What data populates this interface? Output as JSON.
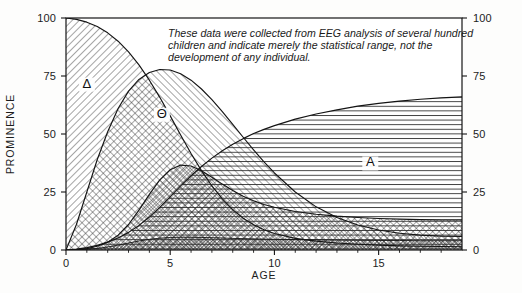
{
  "figure": {
    "annotation_lines": [
      "These data were collected from EEG analysis of several hundred",
      "children and indicate merely the statistical range, not the",
      "development of any individual."
    ],
    "annotation": "These data were collected from EEG analysis of several hundred children and indicate merely the statistical range, not the development of any individual.",
    "colors": {
      "ink": "#1a1a1a",
      "axis": "#141414",
      "background": "#fdfdfc",
      "hatch": "#2a2a2a"
    }
  },
  "chart_data": {
    "type": "area",
    "title": "",
    "subtitle": "",
    "xlabel": "AGE",
    "ylabel": "PROMINENCE",
    "xlim": [
      0,
      19
    ],
    "ylim": [
      0,
      100
    ],
    "xticks": [
      0,
      5,
      10,
      15
    ],
    "xticklabels": [
      "0",
      "5",
      "10",
      "15"
    ],
    "xminorticks": [
      1,
      2,
      3,
      4,
      6,
      7,
      8,
      9,
      11,
      12,
      13,
      14,
      16,
      17,
      18
    ],
    "yticks": [
      0,
      25,
      50,
      75,
      100
    ],
    "yticklabels": [
      "0",
      "25",
      "50",
      "75",
      "100"
    ],
    "yticks_right": [
      0,
      25,
      50,
      75,
      100
    ],
    "yticklabels_right": [
      "0",
      "25",
      "50",
      "75",
      "100"
    ],
    "grid": false,
    "legend": "inline-labels",
    "annotations": [
      {
        "text": "These data were collected from EEG analysis of several hundred children and indicate merely the statistical range, not the development of any individual.",
        "x": 6.0,
        "y": 94
      }
    ],
    "series": [
      {
        "name": "Delta",
        "label": "Δ",
        "label_x": 1.0,
        "label_y": 70,
        "fill": "diagonal-hatch-right",
        "x": [
          0,
          0.5,
          1,
          1.5,
          2,
          2.5,
          3,
          3.5,
          4,
          4.5,
          5,
          5.5,
          6,
          6.5,
          7,
          7.5,
          8,
          8.5,
          9,
          9.5,
          10,
          11,
          12,
          13,
          14,
          15,
          16,
          17,
          18,
          19
        ],
        "values": [
          100,
          99.4,
          98.2,
          96.3,
          93.6,
          90.0,
          85.4,
          79.8,
          73.2,
          65.8,
          57.8,
          49.6,
          41.6,
          34.2,
          27.6,
          22.0,
          17.4,
          13.7,
          10.9,
          8.7,
          7.1,
          5.0,
          3.8,
          3.0,
          2.5,
          2.1,
          1.8,
          1.6,
          1.5,
          1.4
        ]
      },
      {
        "name": "Theta",
        "label": "Θ",
        "label_x": 4.6,
        "label_y": 57,
        "fill": "diagonal-hatch-left",
        "x": [
          0,
          0.5,
          1,
          1.5,
          2,
          2.5,
          3,
          3.5,
          4,
          4.5,
          5,
          5.5,
          6,
          6.5,
          7,
          7.5,
          8,
          8.5,
          9,
          9.5,
          10,
          11,
          12,
          13,
          14,
          15,
          16,
          17,
          18,
          19
        ],
        "values": [
          0,
          11.0,
          25.0,
          39.0,
          51.0,
          61.0,
          68.5,
          73.5,
          76.5,
          77.8,
          77.6,
          76.0,
          73.2,
          69.4,
          64.8,
          59.6,
          54.2,
          48.6,
          43.2,
          38.0,
          33.2,
          25.0,
          18.6,
          14.0,
          10.8,
          8.6,
          7.2,
          6.4,
          6.0,
          5.8
        ]
      },
      {
        "name": "Alpha",
        "label": "A",
        "label_x": 14.6,
        "label_y": 36,
        "fill": "horizontal-hatch",
        "x": [
          0,
          0.5,
          1,
          1.5,
          2,
          2.5,
          3,
          3.5,
          4,
          4.5,
          5,
          5.5,
          6,
          6.5,
          7,
          7.5,
          8,
          8.5,
          9,
          9.5,
          10,
          11,
          12,
          13,
          14,
          15,
          16,
          17,
          18,
          19
        ],
        "values": [
          0,
          0.4,
          1.0,
          2.0,
          3.4,
          5.2,
          7.6,
          10.6,
          14.2,
          18.4,
          23.0,
          27.6,
          32.0,
          36.0,
          39.6,
          42.8,
          45.6,
          48.0,
          50.2,
          52.0,
          53.6,
          56.4,
          58.6,
          60.4,
          62.0,
          63.2,
          64.2,
          65.0,
          65.6,
          66.0
        ]
      },
      {
        "name": "Beta",
        "label": "",
        "label_x": 8.0,
        "label_y": 8,
        "fill": "cross-hatch",
        "x": [
          0,
          0.5,
          1,
          1.5,
          2,
          2.5,
          3,
          3.5,
          4,
          4.5,
          5,
          5.5,
          6,
          6.5,
          7,
          7.5,
          8,
          8.5,
          9,
          9.5,
          10,
          11,
          12,
          13,
          14,
          15,
          16,
          17,
          18,
          19
        ],
        "values": [
          0,
          0.2,
          0.6,
          1.6,
          3.4,
          6.4,
          11.0,
          17.2,
          24.0,
          30.2,
          34.6,
          36.6,
          36.2,
          34.2,
          31.4,
          28.4,
          25.6,
          23.2,
          21.2,
          19.6,
          18.4,
          16.6,
          15.4,
          14.6,
          14.0,
          13.6,
          13.3,
          13.1,
          13.0,
          13.0
        ]
      },
      {
        "name": "Beta-low",
        "label": "",
        "label_x": 0,
        "label_y": 0,
        "fill": "fine-cross-hatch",
        "x": [
          0,
          0.5,
          1,
          1.5,
          2,
          2.5,
          3,
          3.5,
          4,
          4.5,
          5,
          5.5,
          6,
          6.5,
          7,
          7.5,
          8,
          8.5,
          9,
          9.5,
          10,
          11,
          12,
          13,
          14,
          15,
          16,
          17,
          18,
          19
        ],
        "values": [
          0,
          0.1,
          0.3,
          0.7,
          1.3,
          2.1,
          3.0,
          3.9,
          4.6,
          5.1,
          5.4,
          5.5,
          5.5,
          5.4,
          5.3,
          5.2,
          5.0,
          4.9,
          4.8,
          4.7,
          4.6,
          4.5,
          4.4,
          4.3,
          4.2,
          4.1,
          4.1,
          4.0,
          4.0,
          4.0
        ]
      }
    ]
  }
}
